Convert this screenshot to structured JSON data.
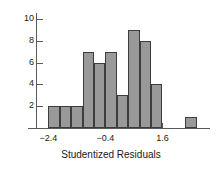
{
  "chart_data": {
    "type": "bar",
    "title": "",
    "subtitle": "",
    "xlabel": "Studentized Residuals",
    "ylabel": "",
    "grid": false,
    "legend": null,
    "bin_width": 0.4,
    "bin_starts": [
      -2.4,
      -2.0,
      -1.6,
      -1.2,
      -0.8,
      -0.4,
      0.0,
      0.4,
      0.8,
      1.2,
      1.6,
      2.4
    ],
    "categories": [
      "-2.4",
      "-2.0",
      "-1.6",
      "-1.2",
      "-0.8",
      "-0.4",
      "0.0",
      "0.4",
      "0.8",
      "1.2",
      "1.6",
      "2.4"
    ],
    "values": [
      2,
      2,
      2,
      7,
      6,
      7,
      3,
      9,
      8,
      4,
      0,
      1
    ],
    "xlim": [
      -2.8,
      3.2
    ],
    "ylim": [
      0,
      10.6
    ],
    "xticks": [
      -2.4,
      -0.4,
      1.6
    ],
    "xtick_labels": [
      "−2.4",
      "−0.4",
      "1.6"
    ],
    "yticks": [
      2,
      4,
      6,
      8,
      10
    ],
    "ytick_labels": [
      "2",
      "4",
      "6",
      "8",
      "10"
    ],
    "colors": {
      "bar_fill": "#999999",
      "bar_edge": "#3d3d3d",
      "axis": "#5a5a5a",
      "text": "#1a1a1a",
      "background": "#ffffff"
    }
  }
}
